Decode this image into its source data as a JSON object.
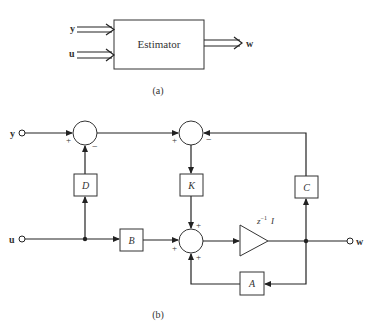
{
  "figure_a": {
    "block_label": "Estimator",
    "inputs": [
      "y",
      "u"
    ],
    "output": "w",
    "caption": "(a)"
  },
  "figure_b": {
    "input_y": "y",
    "input_u": "u",
    "output_w": "w",
    "blocks": {
      "D": "D",
      "K": "K",
      "C": "C",
      "B": "B",
      "A": "A"
    },
    "delay": {
      "base": "z",
      "exponent": "−1",
      "matrix": "I"
    },
    "signs": {
      "sum1_plus": "+",
      "sum1_minus": "−",
      "sum2_plus": "+",
      "sum2_minus": "−",
      "sum3_top": "+",
      "sum3_left": "+",
      "sum3_bottom": "+"
    },
    "caption": "(b)"
  }
}
